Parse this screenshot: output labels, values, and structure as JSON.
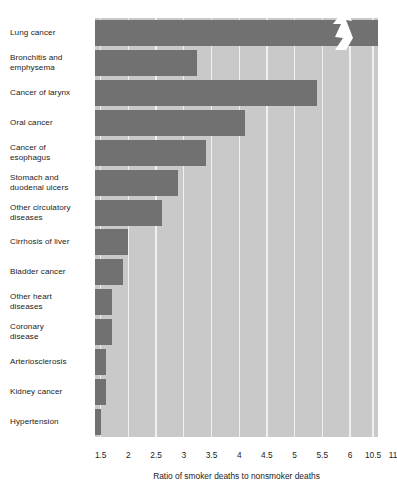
{
  "chart_data": {
    "type": "bar",
    "orientation": "horizontal",
    "title": "",
    "xlabel": "Ratio of smoker deaths to nonsmoker deaths",
    "ylabel": "",
    "xlim": [
      1.0,
      11.0
    ],
    "axis_break": {
      "present": true,
      "from": 6.0,
      "to": 10.5,
      "marker": "zigzag"
    },
    "grid": true,
    "gridline_color": "#f0f0f0",
    "bar_color": "#717171",
    "plot_background": "#c9c9c9",
    "legend": null,
    "tick_labels": [
      "1.5",
      "2",
      "2.5",
      "3",
      "3.5",
      "4",
      "4.5",
      "5",
      "5.5",
      "6",
      "10.5",
      "11"
    ],
    "tick_values": [
      1.5,
      2,
      2.5,
      3,
      3.5,
      4,
      4.5,
      5,
      5.5,
      6,
      10.5,
      11
    ],
    "categories": [
      "Lung cancer",
      "Bronchitis and emphysema",
      "Cancer of larynx",
      "Oral cancer",
      "Cancer of esophagus",
      "Stomach and duodenal ulcers",
      "Other circulatory diseases",
      "Cirrhosis of liver",
      "Bladder cancer",
      "Other heart diseases",
      "Coronary disease",
      "Arteriosclerosis",
      "Kidney cancer",
      "Hypertension"
    ],
    "values": [
      11.0,
      6.1,
      5.4,
      4.1,
      3.4,
      2.9,
      2.6,
      2.0,
      1.9,
      1.7,
      1.7,
      1.6,
      1.6,
      1.5
    ]
  },
  "labels": [
    {
      "lines": [
        "Lung cancer"
      ]
    },
    {
      "lines": [
        "Bronchitis and",
        "emphysema"
      ]
    },
    {
      "lines": [
        "Cancer of larynx"
      ]
    },
    {
      "lines": [
        "Oral cancer"
      ]
    },
    {
      "lines": [
        "Cancer of",
        "esophagus"
      ]
    },
    {
      "lines": [
        "Stomach and",
        "duodenal ulcers"
      ]
    },
    {
      "lines": [
        "Other circulatory",
        "diseases"
      ]
    },
    {
      "lines": [
        "Cirrhosis of liver"
      ]
    },
    {
      "lines": [
        "Bladder cancer"
      ]
    },
    {
      "lines": [
        "Other heart",
        "diseases"
      ]
    },
    {
      "lines": [
        "Coronary",
        "disease"
      ]
    },
    {
      "lines": [
        "Arteriosclerosis"
      ]
    },
    {
      "lines": [
        "Kidney cancer"
      ]
    },
    {
      "lines": [
        "Hypertension"
      ]
    }
  ],
  "axis_title": "Ratio of smoker deaths to nonsmoker deaths"
}
